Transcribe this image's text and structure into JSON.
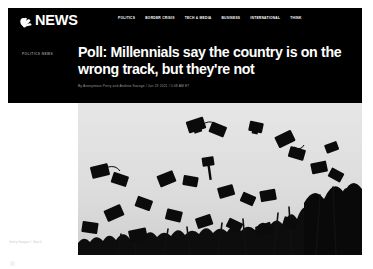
{
  "site": {
    "brand_name": "NEWS",
    "logo_icon": "nbc-peacock-icon",
    "header_bg": "#000000",
    "text_color": "#ffffff"
  },
  "nav": {
    "items": [
      {
        "label": "POLITICS"
      },
      {
        "label": "BORDER CRISIS"
      },
      {
        "label": "TECH & MEDIA"
      },
      {
        "label": "BUSINESS"
      },
      {
        "label": "INTERNATIONAL"
      },
      {
        "label": "THINK"
      }
    ]
  },
  "article": {
    "kicker": "POLITICS NEWS",
    "headline": "Poll: Millennials say the country is on the wrong track, but they're not",
    "byline": "By Anonymous Perry and Andrew Savage / Jun 19 2021 / 5:08 AM ET"
  },
  "photo": {
    "alt": "Graduation caps thrown into the air by graduates",
    "credit": "Getty Images / Stock",
    "sky_color": "#dedede",
    "cap_color": "#0b0b0b"
  }
}
